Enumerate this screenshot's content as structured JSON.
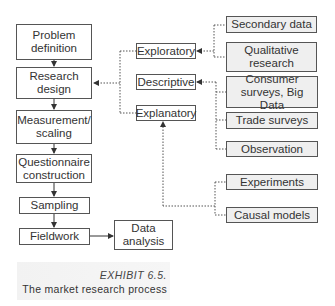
{
  "diagram": {
    "main_flow": [
      {
        "id": "problem_definition",
        "label": "Problem definition"
      },
      {
        "id": "research_design",
        "label": "Research design"
      },
      {
        "id": "measurement_scaling",
        "label": "Measurement/ scaling"
      },
      {
        "id": "questionnaire_construction",
        "label": "Questionnaire construction"
      },
      {
        "id": "sampling",
        "label": "Sampling"
      },
      {
        "id": "fieldwork",
        "label": "Fieldwork"
      },
      {
        "id": "data_analysis",
        "label": "Data analysis"
      }
    ],
    "design_types": [
      {
        "id": "exploratory",
        "label": "Exploratory"
      },
      {
        "id": "descriptive",
        "label": "Descriptive"
      },
      {
        "id": "explanatory",
        "label": "Explanatory"
      }
    ],
    "methods": [
      {
        "id": "secondary_data",
        "label": "Secondary data",
        "feeds": "exploratory"
      },
      {
        "id": "qualitative_research",
        "label": "Qualitative research",
        "feeds": "exploratory"
      },
      {
        "id": "consumer_surveys",
        "label": "Consumer surveys, Big Data",
        "feeds": "descriptive"
      },
      {
        "id": "trade_surveys",
        "label": "Trade surveys",
        "feeds": "descriptive"
      },
      {
        "id": "observation",
        "label": "Observation",
        "feeds": "descriptive"
      },
      {
        "id": "experiments",
        "label": "Experiments",
        "feeds": "explanatory"
      },
      {
        "id": "causal_models",
        "label": "Causal models",
        "feeds": "explanatory"
      }
    ],
    "edges": [
      {
        "from": "problem_definition",
        "to": "research_design",
        "style": "solid"
      },
      {
        "from": "research_design",
        "to": "measurement_scaling",
        "style": "solid"
      },
      {
        "from": "measurement_scaling",
        "to": "questionnaire_construction",
        "style": "solid"
      },
      {
        "from": "questionnaire_construction",
        "to": "sampling",
        "style": "solid"
      },
      {
        "from": "sampling",
        "to": "fieldwork",
        "style": "solid"
      },
      {
        "from": "fieldwork",
        "to": "data_analysis",
        "style": "solid"
      },
      {
        "from": "design_types",
        "to": "research_design",
        "style": "dotted"
      },
      {
        "from": "secondary_data",
        "to": "exploratory",
        "style": "dotted"
      },
      {
        "from": "qualitative_research",
        "to": "exploratory",
        "style": "dotted"
      },
      {
        "from": "consumer_surveys",
        "to": "descriptive",
        "style": "dotted"
      },
      {
        "from": "trade_surveys",
        "to": "descriptive",
        "style": "dotted"
      },
      {
        "from": "observation",
        "to": "descriptive",
        "style": "dotted"
      },
      {
        "from": "experiments",
        "to": "explanatory",
        "style": "dotted"
      },
      {
        "from": "causal_models",
        "to": "explanatory",
        "style": "dotted"
      }
    ]
  },
  "caption": {
    "title": "EXHIBIT 6.5.",
    "subtitle": "The market research process"
  }
}
